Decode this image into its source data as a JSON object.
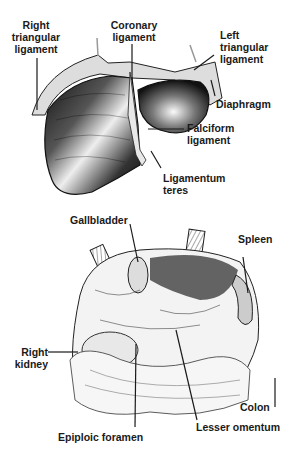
{
  "figure": {
    "top_panel": {
      "subject": "liver",
      "labels": [
        {
          "id": "right-triangular-ligament",
          "text": "Right\ntriangular\nligament"
        },
        {
          "id": "coronary-ligament",
          "text": "Coronary\nligament"
        },
        {
          "id": "left-triangular-ligament",
          "text": "Left\ntriangular\nligament"
        },
        {
          "id": "diaphragm",
          "text": "Diaphragm"
        },
        {
          "id": "falciform-ligament",
          "text": "Falciform\nligament"
        },
        {
          "id": "ligamentum-teres",
          "text": "Ligamentum\nteres"
        }
      ]
    },
    "bottom_panel": {
      "subject": "upper abdominal viscera",
      "labels": [
        {
          "id": "gallbladder",
          "text": "Gallbladder"
        },
        {
          "id": "spleen",
          "text": "Spleen"
        },
        {
          "id": "right-kidney",
          "text": "Right\nkidney"
        },
        {
          "id": "colon",
          "text": "Colon"
        },
        {
          "id": "epiploic-foramen",
          "text": "Epiploic foramen"
        },
        {
          "id": "lesser-omentum",
          "text": "Lesser omentum"
        }
      ]
    },
    "colors": {
      "ink": "#1a1a1a",
      "background": "#ffffff"
    }
  }
}
